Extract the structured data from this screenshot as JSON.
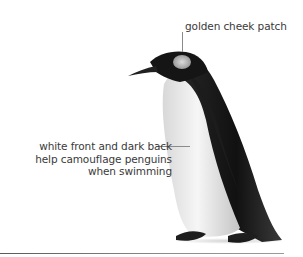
{
  "figure": {
    "annotations": [
      {
        "id": "cheek",
        "text": "golden cheek patch"
      },
      {
        "id": "camouflage",
        "lines": [
          "white front and dark back",
          "help camouflage penguins",
          "when swimming"
        ]
      }
    ]
  },
  "colors": {
    "text": "#3a3a3a",
    "leader_line": "#8a8a8a",
    "penguin_dark": "#1a1a1a",
    "penguin_light": "#f2f2f2",
    "baseline": "#6a6a6a"
  }
}
